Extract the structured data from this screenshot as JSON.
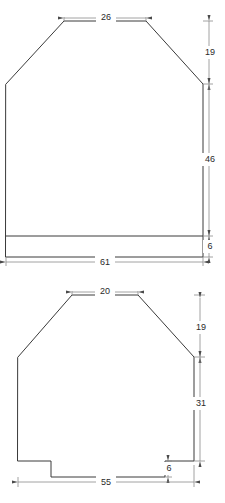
{
  "drawing": {
    "title": "Garment pattern pieces technical drawing",
    "units_note": "",
    "line_color": "#3a3a3a",
    "dimension_color": "#8a8a8a",
    "text_color": "#2a2a2a",
    "background": "#ffffff",
    "pieces": [
      {
        "id": "upper-piece",
        "name": "Upper pattern piece",
        "dimensions": [
          {
            "id": "upper-top-width",
            "label": "26",
            "orientation": "horizontal",
            "position": "top"
          },
          {
            "id": "upper-shoulder-height",
            "label": "19",
            "orientation": "vertical",
            "position": "right-upper"
          },
          {
            "id": "upper-body-height",
            "label": "46",
            "orientation": "vertical",
            "position": "right-middle"
          },
          {
            "id": "upper-hem-height",
            "label": "6",
            "orientation": "vertical",
            "position": "right-lower"
          },
          {
            "id": "upper-bottom-width",
            "label": "61",
            "orientation": "horizontal",
            "position": "bottom"
          }
        ]
      },
      {
        "id": "lower-piece",
        "name": "Lower pattern piece",
        "dimensions": [
          {
            "id": "lower-top-width",
            "label": "20",
            "orientation": "horizontal",
            "position": "top"
          },
          {
            "id": "lower-shoulder-height",
            "label": "19",
            "orientation": "vertical",
            "position": "right-upper"
          },
          {
            "id": "lower-body-height",
            "label": "31",
            "orientation": "vertical",
            "position": "right-middle"
          },
          {
            "id": "lower-notch-height",
            "label": "6",
            "orientation": "vertical",
            "position": "right-lower"
          },
          {
            "id": "lower-bottom-width",
            "label": "55",
            "orientation": "horizontal",
            "position": "bottom"
          }
        ]
      }
    ]
  }
}
